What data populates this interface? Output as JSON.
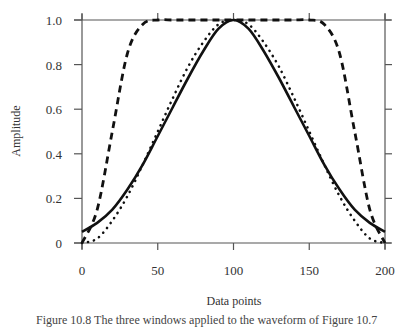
{
  "chart_data": {
    "type": "line",
    "title": "",
    "xlabel": "Data points",
    "ylabel": "Amplitude",
    "xlim": [
      0,
      200
    ],
    "ylim": [
      0,
      1.0
    ],
    "xticks": [
      0,
      50,
      100,
      150,
      200
    ],
    "xtick_labels": [
      "0",
      "50",
      "100",
      "150",
      "200"
    ],
    "yticks": [
      0,
      0.2,
      0.4,
      0.6,
      0.8,
      1.0
    ],
    "ytick_labels": [
      "0",
      "0.2",
      "0.4",
      "0.6",
      "0.8",
      "1.0"
    ],
    "grid": false,
    "legend": "none",
    "x": [
      0,
      10,
      20,
      30,
      40,
      50,
      60,
      70,
      80,
      90,
      100,
      110,
      120,
      130,
      140,
      150,
      160,
      170,
      180,
      190,
      200
    ],
    "series": [
      {
        "name": "solid",
        "style": "solid",
        "values": [
          0.05,
          0.09,
          0.15,
          0.24,
          0.35,
          0.48,
          0.61,
          0.74,
          0.86,
          0.96,
          1.0,
          0.96,
          0.86,
          0.74,
          0.61,
          0.48,
          0.35,
          0.24,
          0.15,
          0.09,
          0.05
        ]
      },
      {
        "name": "dotted",
        "style": "dotted",
        "values": [
          0.0,
          0.02,
          0.1,
          0.21,
          0.35,
          0.5,
          0.65,
          0.79,
          0.9,
          0.98,
          1.0,
          0.98,
          0.9,
          0.79,
          0.65,
          0.5,
          0.35,
          0.21,
          0.1,
          0.02,
          0.0
        ]
      },
      {
        "name": "dashed",
        "style": "dashed",
        "values": [
          0.0,
          0.15,
          0.5,
          0.85,
          0.98,
          1.0,
          1.0,
          1.0,
          1.0,
          1.0,
          1.0,
          1.0,
          1.0,
          1.0,
          1.0,
          1.0,
          0.98,
          0.85,
          0.5,
          0.15,
          0.0
        ]
      }
    ]
  },
  "caption": "Figure 10.8   The three windows applied to the waveform of Figure 10.7"
}
